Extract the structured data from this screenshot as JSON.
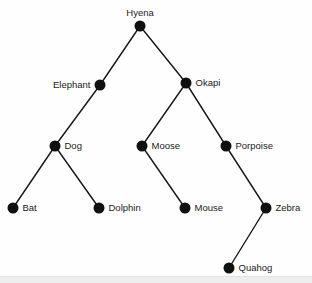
{
  "diagram": {
    "type": "tree",
    "width": 312,
    "height": 283,
    "background_color": "#fefefe",
    "node_color": "#101010",
    "edge_color": "#161616",
    "label_color": "#1a1a1a",
    "node_radius": 5.5,
    "nodes": [
      {
        "id": "hyena",
        "label": "Hyena",
        "x": 140,
        "y": 26,
        "label_pos": "above"
      },
      {
        "id": "elephant",
        "label": "Elephant",
        "x": 100,
        "y": 85,
        "label_pos": "left"
      },
      {
        "id": "okapi",
        "label": "Okapi",
        "x": 186,
        "y": 83,
        "label_pos": "right"
      },
      {
        "id": "dog",
        "label": "Dog",
        "x": 55,
        "y": 146,
        "label_pos": "right"
      },
      {
        "id": "moose",
        "label": "Moose",
        "x": 142,
        "y": 146,
        "label_pos": "right"
      },
      {
        "id": "porpoise",
        "label": "Porpoise",
        "x": 226,
        "y": 146,
        "label_pos": "right"
      },
      {
        "id": "bat",
        "label": "Bat",
        "x": 13,
        "y": 208,
        "label_pos": "right"
      },
      {
        "id": "dolphin",
        "label": "Dolphin",
        "x": 99,
        "y": 208,
        "label_pos": "right"
      },
      {
        "id": "mouse",
        "label": "Mouse",
        "x": 185,
        "y": 208,
        "label_pos": "right"
      },
      {
        "id": "zebra",
        "label": "Zebra",
        "x": 266,
        "y": 208,
        "label_pos": "right"
      },
      {
        "id": "quahog",
        "label": "Quahog",
        "x": 229,
        "y": 268,
        "label_pos": "right"
      }
    ],
    "edges": [
      {
        "from": "hyena",
        "to": "elephant"
      },
      {
        "from": "hyena",
        "to": "okapi"
      },
      {
        "from": "elephant",
        "to": "dog"
      },
      {
        "from": "okapi",
        "to": "moose"
      },
      {
        "from": "okapi",
        "to": "porpoise"
      },
      {
        "from": "dog",
        "to": "bat"
      },
      {
        "from": "dog",
        "to": "dolphin"
      },
      {
        "from": "moose",
        "to": "mouse"
      },
      {
        "from": "porpoise",
        "to": "zebra"
      },
      {
        "from": "zebra",
        "to": "quahog"
      }
    ]
  }
}
